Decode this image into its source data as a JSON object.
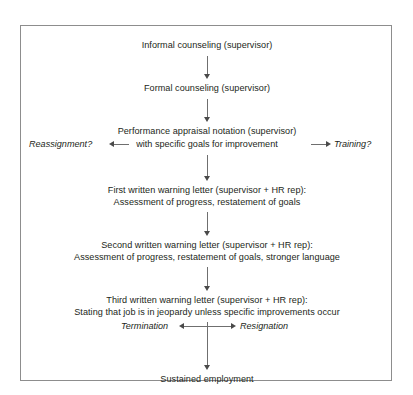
{
  "figure": {
    "type": "flowchart",
    "title_visible": false,
    "border_color": "#8d8d8d",
    "text_color": "#231f20",
    "connector_color": "#6f6f6f",
    "background": "#ffffff"
  },
  "nodes": [
    {
      "id": "informal-counseling",
      "lines": [
        "Informal counseling (supervisor)"
      ]
    },
    {
      "id": "formal-counseling",
      "lines": [
        "Formal counseling (supervisor)"
      ]
    },
    {
      "id": "performance-appraisal-notation",
      "lines": [
        "Performance appraisal notation (supervisor)"
      ]
    },
    {
      "id": "first-written-warning",
      "lines": [
        "First written warning letter (supervisor + HR rep):",
        "Assessment of progress, restatement of goals"
      ]
    },
    {
      "id": "second-written-warning",
      "lines": [
        "Second written warning letter (supervisor + HR rep):",
        "Assessment of progress, restatement of goals, stronger language"
      ]
    },
    {
      "id": "third-written-warning",
      "lines": [
        "Third written warning letter (supervisor + HR rep):",
        "Stating that job is in jeopardy unless specific improvements occur"
      ]
    },
    {
      "id": "sustained-employment",
      "lines": [
        "Sustained employment"
      ]
    }
  ],
  "branch_row": {
    "left_label": "Reassignment?",
    "center_label": "with specific goals for improvement",
    "right_label": "Training?"
  },
  "outcome_row": {
    "left_label": "Termination",
    "right_label": "Resignation"
  },
  "icons": {
    "arrow_down": "arrow-down-icon",
    "arrow_left": "arrow-left-icon",
    "arrow_right": "arrow-right-icon"
  }
}
